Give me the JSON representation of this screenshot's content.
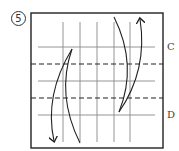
{
  "step": {
    "number": "5"
  },
  "labels": {
    "c": "C",
    "d": "D"
  },
  "diagram": {
    "vertical_creases": 5,
    "solid_horizontal_creases": 3,
    "dashed_fold_lines": 2,
    "arrows": [
      "left-fold-down-arrow",
      "right-fold-up-arrow"
    ],
    "colors": {
      "line": "#333333",
      "grid": "#777777"
    }
  }
}
